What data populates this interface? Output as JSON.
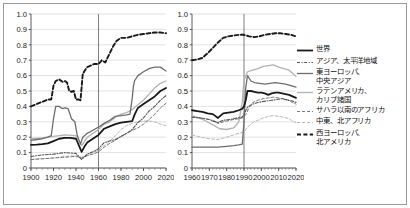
{
  "figure": {
    "background": "#ffffff",
    "border_color": "#9a9a9a"
  },
  "legend": {
    "position": "right",
    "entries": [
      {
        "label": "世界",
        "key": "solid-thick-black",
        "color": "#1a1a1a",
        "dash": "none",
        "width": 1.8
      },
      {
        "label": "アジア、太平洋地域",
        "key": "dashdot-gray",
        "color": "#555555",
        "dash": "3,1.6,1,1.6",
        "width": 1.1
      },
      {
        "label": "東ヨーロッパ、\n中央アジア",
        "key": "solid-gray",
        "color": "#6e6e6e",
        "dash": "none",
        "width": 1.3
      },
      {
        "label": "ラテンアメリカ、\nカリブ諸国",
        "key": "solid-lightgray",
        "color": "#b2b2b2",
        "dash": "none",
        "width": 1.3
      },
      {
        "label": "サハラ以南のアフリカ",
        "key": "dashed-gray",
        "color": "#7a7a7a",
        "dash": "3,2",
        "width": 1.0
      },
      {
        "label": "中東、北アフリカ",
        "key": "dashed-lightgray",
        "color": "#b8b8b8",
        "dash": "3,2",
        "width": 1.0
      },
      {
        "label": "西ヨーロッパ、\n北アメリカ",
        "key": "dashed-thick-black",
        "color": "#1a1a1a",
        "dash": "4,2.4",
        "width": 1.9
      }
    ]
  },
  "chart_data": [
    {
      "id": "left",
      "type": "line",
      "title": "",
      "xlabel": "",
      "ylabel": "",
      "xlim": [
        1900,
        2020
      ],
      "ylim": [
        0,
        1.0
      ],
      "xticks": [
        1900,
        1920,
        1940,
        1960,
        1980,
        2000,
        2020
      ],
      "xticklabels": [
        "1900",
        "1920",
        "1940",
        "1960",
        "1980",
        "2000",
        "2020"
      ],
      "yticks": [
        0,
        0.1,
        0.2,
        0.3,
        0.4,
        0.5,
        0.6,
        0.7,
        0.8,
        0.9,
        1.0
      ],
      "yticklabels": [
        "0",
        "0.1",
        "0.2",
        "0.3",
        "0.4",
        "0.5",
        "0.6",
        "0.7",
        "0.8",
        "0.9",
        "1.0"
      ],
      "grid": "horizontal",
      "vline": 1960,
      "series": [
        {
          "name": "世界",
          "color": "#1a1a1a",
          "dash": "none",
          "width": 1.8,
          "x": [
            1900,
            1905,
            1910,
            1915,
            1920,
            1925,
            1930,
            1935,
            1940,
            1945,
            1948,
            1950,
            1955,
            1960,
            1965,
            1970,
            1975,
            1980,
            1985,
            1990,
            1992,
            1995,
            2000,
            2005,
            2010,
            2015,
            2020
          ],
          "y": [
            0.15,
            0.152,
            0.155,
            0.16,
            0.175,
            0.19,
            0.195,
            0.195,
            0.19,
            0.105,
            0.145,
            0.165,
            0.19,
            0.215,
            0.255,
            0.27,
            0.285,
            0.295,
            0.3,
            0.305,
            0.345,
            0.39,
            0.415,
            0.44,
            0.465,
            0.5,
            0.52
          ]
        },
        {
          "name": "アジア、太平洋地域",
          "color": "#555555",
          "dash": "3,1.6,1,1.6",
          "width": 1.1,
          "x": [
            1900,
            1910,
            1920,
            1930,
            1940,
            1945,
            1950,
            1955,
            1960,
            1965,
            1970,
            1975,
            1980,
            1985,
            1990,
            1995,
            2000,
            2005,
            2010,
            2015,
            2020
          ],
          "y": [
            0.075,
            0.085,
            0.09,
            0.1,
            0.095,
            0.055,
            0.09,
            0.105,
            0.125,
            0.165,
            0.175,
            0.185,
            0.205,
            0.225,
            0.25,
            0.295,
            0.325,
            0.37,
            0.4,
            0.44,
            0.47
          ]
        },
        {
          "name": "東ヨーロッパ、中央アジア",
          "color": "#6e6e6e",
          "dash": "none",
          "width": 1.3,
          "x": [
            1900,
            1905,
            1910,
            1915,
            1918,
            1920,
            1922,
            1925,
            1928,
            1930,
            1933,
            1936,
            1939,
            1941,
            1944,
            1946,
            1950,
            1955,
            1960,
            1965,
            1970,
            1975,
            1980,
            1985,
            1988,
            1990,
            1991,
            1992,
            1995,
            2000,
            2005,
            2010,
            2015,
            2020
          ],
          "y": [
            0.18,
            0.185,
            0.19,
            0.2,
            0.21,
            0.32,
            0.4,
            0.4,
            0.385,
            0.39,
            0.385,
            0.32,
            0.3,
            0.215,
            0.155,
            0.2,
            0.225,
            0.245,
            0.265,
            0.29,
            0.31,
            0.335,
            0.34,
            0.345,
            0.35,
            0.455,
            0.53,
            0.565,
            0.6,
            0.625,
            0.645,
            0.655,
            0.655,
            0.63
          ]
        },
        {
          "name": "ラテンアメリカ、カリブ諸国",
          "color": "#b2b2b2",
          "dash": "none",
          "width": 1.3,
          "x": [
            1900,
            1910,
            1920,
            1930,
            1940,
            1945,
            1950,
            1955,
            1960,
            1965,
            1970,
            1975,
            1980,
            1985,
            1990,
            1995,
            2000,
            2005,
            2010,
            2015,
            2020
          ],
          "y": [
            0.19,
            0.195,
            0.205,
            0.215,
            0.21,
            0.145,
            0.2,
            0.225,
            0.25,
            0.285,
            0.3,
            0.33,
            0.35,
            0.36,
            0.38,
            0.41,
            0.44,
            0.48,
            0.52,
            0.55,
            0.565
          ]
        },
        {
          "name": "サハラ以南のアフリカ",
          "color": "#7a7a7a",
          "dash": "3,2",
          "width": 1.0,
          "x": [
            1900,
            1910,
            1920,
            1930,
            1940,
            1945,
            1950,
            1955,
            1960,
            1965,
            1970,
            1975,
            1980,
            1985,
            1990,
            1995,
            2000,
            2005,
            2010,
            2015,
            2020
          ],
          "y": [
            0.055,
            0.06,
            0.065,
            0.07,
            0.075,
            0.065,
            0.08,
            0.09,
            0.105,
            0.135,
            0.16,
            0.18,
            0.205,
            0.225,
            0.245,
            0.26,
            0.285,
            0.315,
            0.35,
            0.39,
            0.42
          ]
        },
        {
          "name": "中東、北アフリカ",
          "color": "#b8b8b8",
          "dash": "3,2",
          "width": 1.0,
          "x": [
            1900,
            1910,
            1920,
            1930,
            1940,
            1945,
            1950,
            1955,
            1960,
            1965,
            1970,
            1975,
            1980,
            1985,
            1990,
            1995,
            2000,
            2005,
            2010,
            2015,
            2020
          ],
          "y": [
            0.055,
            0.06,
            0.065,
            0.075,
            0.08,
            0.07,
            0.085,
            0.1,
            0.115,
            0.145,
            0.175,
            0.21,
            0.25,
            0.275,
            0.29,
            0.3,
            0.305,
            0.305,
            0.3,
            0.285,
            0.275
          ]
        },
        {
          "name": "西ヨーロッパ、北アメリカ",
          "color": "#1a1a1a",
          "dash": "4,2.4",
          "width": 1.9,
          "x": [
            1900,
            1905,
            1910,
            1915,
            1918,
            1920,
            1922,
            1925,
            1928,
            1930,
            1932,
            1934,
            1936,
            1938,
            1940,
            1942,
            1944,
            1946,
            1948,
            1950,
            1953,
            1956,
            1960,
            1963,
            1966,
            1970,
            1973,
            1976,
            1980,
            1985,
            1990,
            1995,
            2000,
            2005,
            2010,
            2015,
            2020
          ],
          "y": [
            0.4,
            0.415,
            0.43,
            0.445,
            0.445,
            0.535,
            0.565,
            0.575,
            0.56,
            0.565,
            0.555,
            0.5,
            0.495,
            0.5,
            0.445,
            0.445,
            0.44,
            0.61,
            0.635,
            0.655,
            0.665,
            0.675,
            0.675,
            0.7,
            0.685,
            0.745,
            0.79,
            0.825,
            0.845,
            0.845,
            0.855,
            0.865,
            0.87,
            0.875,
            0.88,
            0.88,
            0.875
          ]
        }
      ]
    },
    {
      "id": "right",
      "type": "line",
      "title": "",
      "xlabel": "",
      "ylabel": "",
      "xlim": [
        1960,
        2020
      ],
      "ylim": [
        0,
        1.0
      ],
      "xticks": [
        1960,
        1970,
        1980,
        1990,
        2000,
        2010,
        2020
      ],
      "xticklabels": [
        "1960",
        "1970",
        "1980",
        "1990",
        "2000",
        "2010",
        "2020"
      ],
      "yticks": [
        0,
        0.1,
        0.2,
        0.3,
        0.4,
        0.5,
        0.6,
        0.7,
        0.8,
        0.9,
        1.0
      ],
      "yticklabels": [
        "0",
        "0.1",
        "0.2",
        "0.3",
        "0.4",
        "0.5",
        "0.6",
        "0.7",
        "0.8",
        "0.9",
        "1.0"
      ],
      "grid": "horizontal",
      "vline": 1990,
      "series": [
        {
          "name": "世界",
          "color": "#1a1a1a",
          "dash": "none",
          "width": 1.8,
          "x": [
            1960,
            1963,
            1966,
            1969,
            1972,
            1975,
            1978,
            1981,
            1984,
            1987,
            1989,
            1990,
            1991,
            1992,
            1994,
            1996,
            1998,
            2000,
            2002,
            2004,
            2006,
            2008,
            2010,
            2012,
            2014,
            2016,
            2018,
            2020
          ],
          "y": [
            0.375,
            0.37,
            0.365,
            0.355,
            0.35,
            0.325,
            0.355,
            0.36,
            0.365,
            0.375,
            0.385,
            0.4,
            0.44,
            0.5,
            0.5,
            0.495,
            0.49,
            0.49,
            0.485,
            0.475,
            0.485,
            0.49,
            0.49,
            0.485,
            0.48,
            0.475,
            0.465,
            0.455
          ]
        },
        {
          "name": "アジア、太平洋地域",
          "color": "#555555",
          "dash": "3,1.6,1,1.6",
          "width": 1.1,
          "x": [
            1960,
            1965,
            1970,
            1975,
            1978,
            1982,
            1986,
            1989,
            1990,
            1992,
            1995,
            1998,
            2000,
            2003,
            2006,
            2009,
            2012,
            2015,
            2018,
            2020
          ],
          "y": [
            0.33,
            0.325,
            0.315,
            0.295,
            0.31,
            0.315,
            0.325,
            0.33,
            0.35,
            0.395,
            0.415,
            0.425,
            0.43,
            0.435,
            0.44,
            0.445,
            0.45,
            0.44,
            0.435,
            0.425
          ]
        },
        {
          "name": "東ヨーロッパ、中央アジア",
          "color": "#6e6e6e",
          "dash": "none",
          "width": 1.3,
          "x": [
            1960,
            1965,
            1970,
            1975,
            1980,
            1984,
            1987,
            1989,
            1990,
            1991,
            1992,
            1994,
            1996,
            1999,
            2002,
            2005,
            2008,
            2011,
            2014,
            2017,
            2020
          ],
          "y": [
            0.135,
            0.135,
            0.135,
            0.135,
            0.14,
            0.145,
            0.15,
            0.155,
            0.3,
            0.52,
            0.6,
            0.565,
            0.555,
            0.55,
            0.545,
            0.55,
            0.555,
            0.55,
            0.545,
            0.535,
            0.525
          ]
        },
        {
          "name": "ラテンアメリカ、カリブ諸国",
          "color": "#b2b2b2",
          "dash": "none",
          "width": 1.3,
          "x": [
            1960,
            1964,
            1968,
            1972,
            1976,
            1980,
            1984,
            1987,
            1989,
            1990,
            1992,
            1995,
            1998,
            2001,
            2004,
            2007,
            2010,
            2013,
            2016,
            2018,
            2020
          ],
          "y": [
            0.34,
            0.325,
            0.305,
            0.28,
            0.255,
            0.25,
            0.26,
            0.3,
            0.43,
            0.57,
            0.625,
            0.635,
            0.645,
            0.66,
            0.665,
            0.67,
            0.655,
            0.645,
            0.635,
            0.615,
            0.595
          ]
        },
        {
          "name": "サハラ以南のアフリカ",
          "color": "#7a7a7a",
          "dash": "3,2",
          "width": 1.0,
          "x": [
            1960,
            1965,
            1970,
            1975,
            1980,
            1984,
            1987,
            1989,
            1991,
            1993,
            1995,
            1998,
            2001,
            2004,
            2007,
            2010,
            2013,
            2016,
            2018,
            2020
          ],
          "y": [
            0.33,
            0.325,
            0.315,
            0.29,
            0.305,
            0.315,
            0.32,
            0.325,
            0.345,
            0.395,
            0.425,
            0.44,
            0.45,
            0.455,
            0.46,
            0.455,
            0.45,
            0.44,
            0.425,
            0.415
          ]
        },
        {
          "name": "中東、北アフリカ",
          "color": "#b8b8b8",
          "dash": "3,2",
          "width": 1.0,
          "x": [
            1960,
            1965,
            1970,
            1975,
            1980,
            1984,
            1987,
            1990,
            1992,
            1995,
            1998,
            2001,
            2004,
            2007,
            2010,
            2013,
            2016,
            2018,
            2020
          ],
          "y": [
            0.215,
            0.2,
            0.19,
            0.185,
            0.2,
            0.215,
            0.225,
            0.235,
            0.265,
            0.295,
            0.31,
            0.325,
            0.335,
            0.34,
            0.335,
            0.33,
            0.32,
            0.305,
            0.295
          ]
        },
        {
          "name": "西ヨーロッパ、北アメリカ",
          "color": "#1a1a1a",
          "dash": "4,2.4",
          "width": 1.9,
          "x": [
            1960,
            1963,
            1966,
            1969,
            1972,
            1975,
            1978,
            1981,
            1984,
            1987,
            1990,
            1993,
            1996,
            1999,
            2002,
            2005,
            2008,
            2011,
            2014,
            2017,
            2020
          ],
          "y": [
            0.7,
            0.705,
            0.715,
            0.745,
            0.78,
            0.815,
            0.845,
            0.855,
            0.86,
            0.865,
            0.865,
            0.855,
            0.85,
            0.855,
            0.865,
            0.87,
            0.875,
            0.875,
            0.87,
            0.865,
            0.855
          ]
        }
      ]
    }
  ]
}
